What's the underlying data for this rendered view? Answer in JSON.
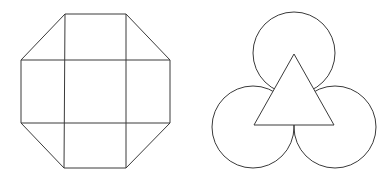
{
  "figures": [
    {
      "id": "octagon-grid",
      "description": "Octagon divided by two vertical and two horizontal lines into a 3x3 arrangement: center square, four edge rectangles, four corner triangles",
      "stroke_color": "#3a3a3a",
      "outline_points": [
        [
          65,
          14
        ],
        [
          126,
          14
        ],
        [
          170,
          60
        ],
        [
          170,
          123
        ],
        [
          126,
          168
        ],
        [
          64,
          168
        ],
        [
          21,
          123
        ],
        [
          21,
          60
        ]
      ],
      "vertical_lines": [
        {
          "x1": 65,
          "y1": 14,
          "x2": 64,
          "y2": 168
        },
        {
          "x1": 126,
          "y1": 14,
          "x2": 126,
          "y2": 168
        }
      ],
      "horizontal_lines": [
        {
          "x1": 21,
          "y1": 60,
          "x2": 170,
          "y2": 60
        },
        {
          "x1": 21,
          "y1": 123,
          "x2": 170,
          "y2": 123
        }
      ]
    },
    {
      "id": "triangle-circles",
      "description": "Three mutually tangent circles centered at vertices of an equilateral triangle, triangle drawn on top",
      "stroke_color": "#3a3a3a",
      "circles": [
        {
          "cx": 294,
          "cy": 53,
          "r": 41
        },
        {
          "cx": 253,
          "cy": 127,
          "r": 41
        },
        {
          "cx": 335,
          "cy": 127,
          "r": 41
        }
      ],
      "triangle_points": [
        [
          294,
          54
        ],
        [
          334,
          125
        ],
        [
          254,
          125
        ]
      ]
    }
  ]
}
